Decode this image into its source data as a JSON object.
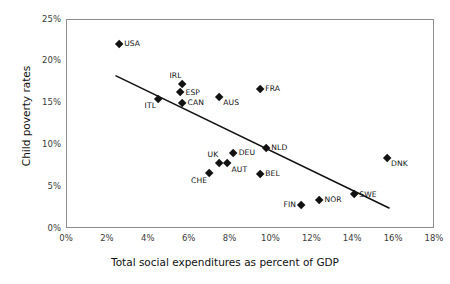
{
  "chart_data": {
    "type": "scatter",
    "title": "",
    "xlabel": "Total social expenditures as percent of GDP",
    "ylabel": "Child poverty rates",
    "xlim": [
      0,
      18
    ],
    "ylim": [
      0,
      25
    ],
    "xticks": [
      "0%",
      "2%",
      "4%",
      "6%",
      "8%",
      "10%",
      "12%",
      "14%",
      "16%",
      "18%"
    ],
    "xtick_values": [
      0,
      2,
      4,
      6,
      8,
      10,
      12,
      14,
      16,
      18
    ],
    "yticks": [
      "0%",
      "5%",
      "10%",
      "15%",
      "20%",
      "25%"
    ],
    "ytick_values": [
      0,
      5,
      10,
      15,
      20,
      25
    ],
    "grid": false,
    "legend": "none",
    "marker": "filled-diamond",
    "marker_color": "#121212",
    "frame_color": "#8d8d8d",
    "points": [
      {
        "label": "USA",
        "x": 2.6,
        "y": 22.0,
        "label_pos": "right"
      },
      {
        "label": "ITL",
        "x": 4.5,
        "y": 15.4,
        "label_pos": "below-left"
      },
      {
        "label": "ESP",
        "x": 5.6,
        "y": 16.2,
        "label_pos": "right"
      },
      {
        "label": "IRL",
        "x": 5.7,
        "y": 17.2,
        "label_pos": "above-left"
      },
      {
        "label": "CAN",
        "x": 5.7,
        "y": 14.9,
        "label_pos": "right"
      },
      {
        "label": "CHE",
        "x": 7.0,
        "y": 6.5,
        "label_pos": "below-left"
      },
      {
        "label": "UK",
        "x": 7.5,
        "y": 7.8,
        "label_pos": "above-left"
      },
      {
        "label": "AUS",
        "x": 7.5,
        "y": 15.7,
        "label_pos": "below-right"
      },
      {
        "label": "AUT",
        "x": 7.9,
        "y": 7.7,
        "label_pos": "below-right"
      },
      {
        "label": "DEU",
        "x": 8.2,
        "y": 9.0,
        "label_pos": "right"
      },
      {
        "label": "FRA",
        "x": 9.5,
        "y": 16.6,
        "label_pos": "right"
      },
      {
        "label": "BEL",
        "x": 9.5,
        "y": 6.4,
        "label_pos": "right"
      },
      {
        "label": "NLD",
        "x": 9.8,
        "y": 9.6,
        "label_pos": "right"
      },
      {
        "label": "FIN",
        "x": 11.5,
        "y": 2.7,
        "label_pos": "left"
      },
      {
        "label": "NOR",
        "x": 12.4,
        "y": 3.3,
        "label_pos": "right"
      },
      {
        "label": "SWE",
        "x": 14.1,
        "y": 4.0,
        "label_pos": "right"
      },
      {
        "label": "DNK",
        "x": 15.7,
        "y": 8.4,
        "label_pos": "below-right"
      }
    ],
    "trendline": {
      "type": "linear-fit",
      "x_start": 2.45,
      "y_start": 18.2,
      "x_end": 15.8,
      "y_end": 2.4,
      "color": "#121212"
    }
  }
}
